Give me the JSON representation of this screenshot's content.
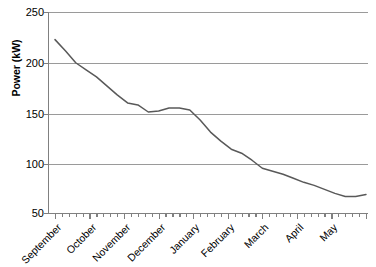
{
  "chart_data": {
    "type": "line",
    "title": "",
    "xlabel": "",
    "ylabel": "Power (kW)",
    "ylim": [
      50,
      250
    ],
    "ytick_labels": [
      "250",
      "200",
      "150",
      "100",
      "50"
    ],
    "ytick_values": [
      250,
      200,
      150,
      100,
      50
    ],
    "grid": true,
    "legend": "none",
    "line_color": "#595959",
    "axis_color": "#808080",
    "categories": [
      "September",
      "October",
      "November",
      "December",
      "January",
      "February",
      "March",
      "April",
      "May"
    ],
    "x_major_tick_labels": [
      "September",
      "October",
      "November",
      "December",
      "January",
      "February",
      "March",
      "April",
      "May"
    ],
    "x_minor_ticks_per_month": 4,
    "series": [
      {
        "name": "Power",
        "x": [
          0.0,
          0.3,
          0.6,
          0.9,
          1.2,
          1.5,
          1.8,
          2.1,
          2.4,
          2.7,
          3.0,
          3.3,
          3.6,
          3.9,
          4.2,
          4.5,
          4.8,
          5.1,
          5.4,
          5.7,
          6.0,
          6.3,
          6.6,
          6.9,
          7.2,
          7.5,
          7.8,
          8.1,
          8.4,
          8.7,
          9.0
        ],
        "values": [
          223,
          212,
          200,
          193,
          186,
          177,
          168,
          160,
          158,
          151,
          152,
          155,
          155,
          153,
          143,
          131,
          122,
          114,
          110,
          103,
          95,
          92,
          89,
          85,
          81,
          78,
          74,
          70,
          67,
          67,
          69
        ]
      }
    ],
    "annotations": {
      "start_value": 223,
      "minimum_value": 67,
      "minimum_near": "March",
      "end_value": 227
    }
  }
}
